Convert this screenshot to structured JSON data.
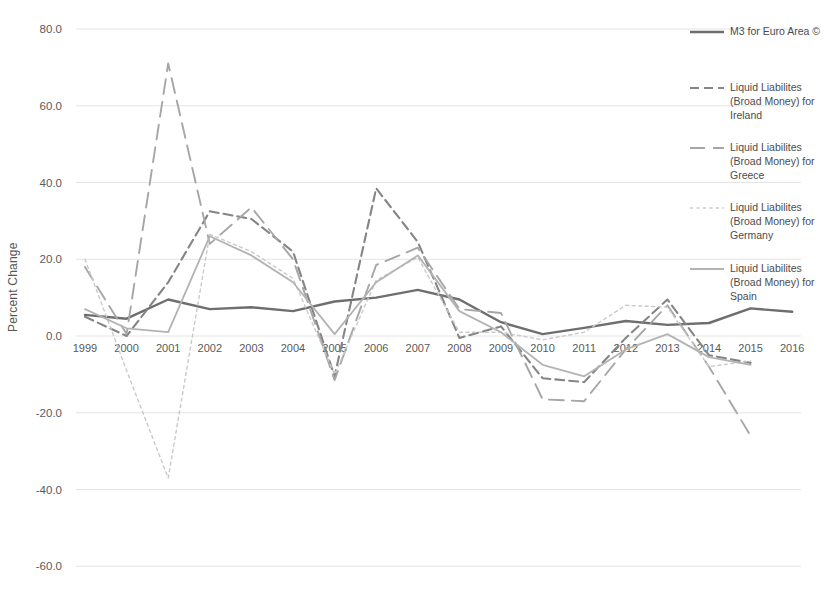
{
  "chart": {
    "ylabel": "Percent Change",
    "background": "#ffffff",
    "grid_color": "#e4e4e4",
    "tick_color": "#5a5a5a",
    "y_tick_labels": [
      "80.0",
      "60.0",
      "40.0",
      "20.0",
      "0.0",
      "-20.0",
      "-40.0",
      "-60.0"
    ],
    "y_tick_values": [
      80,
      60,
      40,
      20,
      0,
      -20,
      -40,
      -60
    ],
    "x_tick_labels": [
      "1999",
      "2000",
      "2001",
      "2002",
      "2003",
      "2004",
      "2005",
      "2006",
      "2007",
      "2008",
      "2009",
      "2010",
      "2011",
      "2012",
      "2013",
      "2014",
      "2015",
      "2016"
    ]
  },
  "chart_data": {
    "type": "line",
    "title": "",
    "xlabel": "",
    "ylabel": "Percent Change",
    "ylim": [
      -60,
      80
    ],
    "grid": true,
    "legend_position": "right",
    "x": [
      1999,
      2000,
      2001,
      2002,
      2003,
      2004,
      2005,
      2006,
      2007,
      2008,
      2009,
      2010,
      2011,
      2012,
      2013,
      2014,
      2015,
      2016
    ],
    "series": [
      {
        "name": "M3 for Euro Area ©",
        "style": "solid",
        "color": "#6e6e6e",
        "width": 2.4,
        "values": [
          5.5,
          4.5,
          9.5,
          7.0,
          7.5,
          6.5,
          9.0,
          10.0,
          12.0,
          9.5,
          3.6,
          0.5,
          2.1,
          3.9,
          2.9,
          3.4,
          7.2,
          6.3
        ]
      },
      {
        "name": "Liquid Liabilites (Broad Money) for Ireland",
        "style": "dashed",
        "color": "#858585",
        "width": 2.1,
        "values": [
          5.0,
          0.0,
          14.0,
          32.5,
          30.5,
          22.0,
          -10.5,
          38.5,
          24.5,
          -0.5,
          2.5,
          -11.0,
          -12.0,
          -0.5,
          9.5,
          -5.0,
          -7.0,
          null
        ]
      },
      {
        "name": "Liquid Liabilites (Broad Money) for Greece",
        "style": "long-dash",
        "color": "#a6a6a6",
        "width": 1.9,
        "values": [
          18.0,
          0.5,
          71.0,
          24.0,
          33.5,
          20.0,
          -11.5,
          18.5,
          23.0,
          7.0,
          6.0,
          -16.5,
          -17.0,
          -3.5,
          8.0,
          -8.0,
          -26.0,
          null
        ]
      },
      {
        "name": "Liquid Liabilites (Broad Money) for Germany",
        "style": "dotted",
        "color": "#c9c9c9",
        "width": 1.4,
        "values": [
          20.0,
          -9.0,
          -37.0,
          26.5,
          22.0,
          15.0,
          -10.0,
          14.5,
          20.5,
          1.0,
          1.0,
          -1.0,
          1.0,
          8.0,
          7.5,
          -8.0,
          -6.5,
          null
        ]
      },
      {
        "name": "Liquid Liabilites (Broad Money) for Spain",
        "style": "solid-light",
        "color": "#b3b3b3",
        "width": 1.8,
        "values": [
          7.0,
          2.0,
          1.0,
          26.0,
          21.0,
          14.0,
          0.5,
          14.0,
          21.0,
          6.5,
          1.0,
          -7.5,
          -10.5,
          -3.5,
          0.5,
          -5.5,
          -7.5,
          null
        ]
      }
    ]
  },
  "legend": {
    "item_tops": [
      24,
      80,
      140,
      200,
      261
    ]
  }
}
